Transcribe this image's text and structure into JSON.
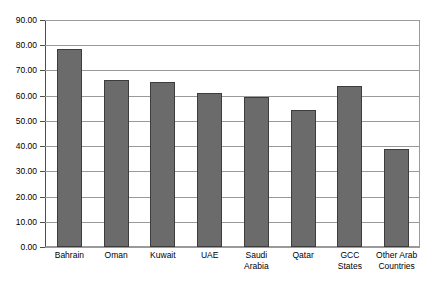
{
  "chart_data": {
    "type": "bar",
    "title": "",
    "subtitle": "",
    "xlabel": "",
    "ylabel": "",
    "categories": [
      "Bahrain",
      "Oman",
      "Kuwait",
      "UAE",
      "Saudi Arabia",
      "Qatar",
      "GCC\nStates",
      "Other Arab\nCountries"
    ],
    "values": [
      78.5,
      66.3,
      65.5,
      61.0,
      59.4,
      54.3,
      63.7,
      38.9
    ],
    "ylim": [
      0,
      90
    ],
    "ytick_step": 10,
    "ytick_labels": [
      "90.00",
      "80.00",
      "70.00",
      "60.00",
      "50.00",
      "40.00",
      "30.00",
      "20.00",
      "10.00",
      "0.00"
    ],
    "ytick_values": [
      90,
      80,
      70,
      60,
      50,
      40,
      30,
      20,
      10,
      0
    ],
    "grid": true,
    "grid_axis": "y",
    "legend": false,
    "legend_position": "none",
    "series": [
      {
        "name": "",
        "values": [
          78.5,
          66.3,
          65.5,
          61.0,
          59.4,
          54.3,
          63.7,
          38.9
        ]
      }
    ],
    "colors": {
      "bar_fill": "#6b6b6b",
      "bar_border": "#3d3d3d",
      "gridline": "#9a9a9a",
      "axis": "#4d4d4d",
      "background": "#ffffff",
      "text": "#000000"
    }
  }
}
